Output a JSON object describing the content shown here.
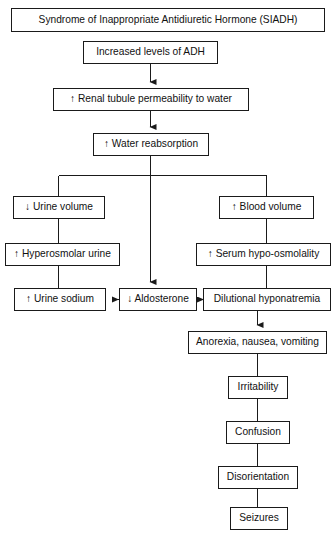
{
  "diagram": {
    "type": "flowchart",
    "orientation": "top-to-bottom",
    "title": "Syndrome of Inappropriate Antidiuretic Hormone (SIADH)",
    "background_color": "#ffffff",
    "line_color": "#1a1a1a",
    "text_color": "#111111",
    "nodes": [
      {
        "id": "siadh",
        "label": "Syndrome of Inappropriate Antidiuretic Hormone (SIADH)",
        "x": 11,
        "y": 8,
        "w": 314,
        "h": 24,
        "font_size": 10.2
      },
      {
        "id": "adh",
        "label": "Increased levels of ADH",
        "x": 83,
        "y": 41,
        "w": 135,
        "h": 23,
        "font_size": 10.2
      },
      {
        "id": "permeability",
        "label": "↑ Renal tubule permeability to water",
        "x": 53,
        "y": 88,
        "w": 196,
        "h": 23,
        "font_size": 10.2
      },
      {
        "id": "reabsorption",
        "label": "↑ Water reabsorption",
        "x": 93,
        "y": 133,
        "w": 116,
        "h": 23,
        "font_size": 10.2
      },
      {
        "id": "urine_volume",
        "label": "↓ Urine volume",
        "x": 13,
        "y": 196,
        "w": 92,
        "h": 23,
        "font_size": 10.2
      },
      {
        "id": "blood_volume",
        "label": "↑ Blood volume",
        "x": 219,
        "y": 196,
        "w": 95,
        "h": 23,
        "font_size": 10.2
      },
      {
        "id": "hyperosmolar",
        "label": "↑ Hyperosmolar urine",
        "x": 5,
        "y": 243,
        "w": 115,
        "h": 23,
        "font_size": 10.2
      },
      {
        "id": "hypo_osmolality",
        "label": "↑ Serum hypo-osmolality",
        "x": 196,
        "y": 243,
        "w": 135,
        "h": 23,
        "font_size": 10.2
      },
      {
        "id": "urine_sodium",
        "label": "↑ Urine sodium",
        "x": 14,
        "y": 288,
        "w": 92,
        "h": 23,
        "font_size": 10.2
      },
      {
        "id": "aldosterone",
        "label": "↓ Aldosterone",
        "x": 119,
        "y": 288,
        "w": 78,
        "h": 23,
        "font_size": 10.2
      },
      {
        "id": "hyponatremia",
        "label": "Dilutional hyponatremia",
        "x": 203,
        "y": 288,
        "w": 128,
        "h": 23,
        "font_size": 10.2
      },
      {
        "id": "anorexia",
        "label": "Anorexia, nausea, vomiting",
        "x": 188,
        "y": 331,
        "w": 139,
        "h": 23,
        "font_size": 10.2
      },
      {
        "id": "irritability",
        "label": "Irritability",
        "x": 228,
        "y": 376,
        "w": 60,
        "h": 23,
        "font_size": 10.2
      },
      {
        "id": "confusion",
        "label": "Confusion",
        "x": 226,
        "y": 421,
        "w": 64,
        "h": 23,
        "font_size": 10.2
      },
      {
        "id": "disorientation",
        "label": "Disorientation",
        "x": 218,
        "y": 466,
        "w": 80,
        "h": 23,
        "font_size": 10.2
      },
      {
        "id": "seizures",
        "label": "Seizures",
        "x": 230,
        "y": 507,
        "w": 58,
        "h": 23,
        "font_size": 10.2
      }
    ],
    "edges": [
      {
        "id": "e-adh-permeability",
        "from": "adh",
        "to": "permeability",
        "arrowhead": true,
        "kind": "vertical"
      },
      {
        "id": "e-permeability-reabsorption",
        "from": "permeability",
        "to": "reabsorption",
        "arrowhead": true,
        "kind": "vertical"
      },
      {
        "id": "e-reabsorption-split",
        "from": "reabsorption",
        "to": "urine_volume",
        "arrowhead": false,
        "kind": "split-left"
      },
      {
        "id": "e-reabsorption-split-right",
        "from": "reabsorption",
        "to": "blood_volume",
        "arrowhead": false,
        "kind": "split-right"
      },
      {
        "id": "e-reabsorption-aldosterone",
        "from": "reabsorption",
        "to": "aldosterone",
        "arrowhead": true,
        "kind": "vertical-long"
      },
      {
        "id": "e-urine-volume-hyperosmolar",
        "from": "urine_volume",
        "to": "hyperosmolar",
        "arrowhead": false,
        "kind": "vertical"
      },
      {
        "id": "e-blood-volume-hypoosmolality",
        "from": "blood_volume",
        "to": "hypo_osmolality",
        "arrowhead": false,
        "kind": "vertical"
      },
      {
        "id": "e-hyperosmolar-urine-sodium",
        "from": "hyperosmolar",
        "to": "urine_sodium",
        "arrowhead": false,
        "kind": "vertical"
      },
      {
        "id": "e-hypoosmolality-hyponatremia",
        "from": "hypo_osmolality",
        "to": "hyponatremia",
        "arrowhead": false,
        "kind": "vertical"
      },
      {
        "id": "e-aldosterone-urine-sodium",
        "from": "aldosterone",
        "to": "urine_sodium",
        "arrowhead": true,
        "kind": "horizontal-left"
      },
      {
        "id": "e-aldosterone-hyponatremia",
        "from": "aldosterone",
        "to": "hyponatremia",
        "arrowhead": true,
        "kind": "horizontal-right"
      },
      {
        "id": "e-hyponatremia-anorexia",
        "from": "hyponatremia",
        "to": "anorexia",
        "arrowhead": true,
        "kind": "vertical"
      },
      {
        "id": "e-anorexia-irritability",
        "from": "anorexia",
        "to": "irritability",
        "arrowhead": false,
        "kind": "vertical"
      },
      {
        "id": "e-irritability-confusion",
        "from": "irritability",
        "to": "confusion",
        "arrowhead": false,
        "kind": "vertical"
      },
      {
        "id": "e-confusion-disorientation",
        "from": "confusion",
        "to": "disorientation",
        "arrowhead": false,
        "kind": "vertical"
      },
      {
        "id": "e-disorientation-seizures",
        "from": "disorientation",
        "to": "seizures",
        "arrowhead": false,
        "kind": "vertical"
      }
    ]
  }
}
